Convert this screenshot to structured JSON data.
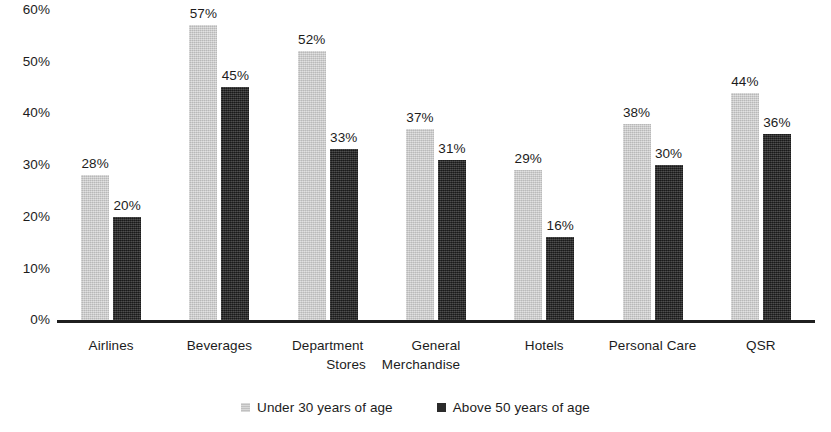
{
  "chart_data": {
    "type": "bar",
    "title": "",
    "subtitle": "",
    "xlabel": "",
    "ylabel": "",
    "ylim": [
      0,
      60
    ],
    "y_ticks": [
      "0%",
      "10%",
      "20%",
      "30%",
      "40%",
      "50%",
      "60%"
    ],
    "y_tick_values": [
      0,
      10,
      20,
      30,
      40,
      50,
      60
    ],
    "grid": false,
    "legend_position": "bottom-center",
    "value_suffix": "%",
    "categories": [
      "Airlines",
      "Department Stores",
      "Beverages",
      "General Merchandise",
      "Hotels",
      "Personal Care",
      "QSR"
    ],
    "category_lines": [
      [
        "Airlines"
      ],
      [
        "Beverages"
      ],
      [
        "Department",
        "Stores"
      ],
      [
        "General",
        "Merchandise"
      ],
      [
        "Hotels"
      ],
      [
        "Personal Care"
      ],
      [
        "QSR"
      ]
    ],
    "series": [
      {
        "name": "Under 30 years of age",
        "color": "#c9c9c9",
        "values": [
          28,
          57,
          52,
          37,
          29,
          38,
          44
        ],
        "labels": [
          "28%",
          "57%",
          "52%",
          "37%",
          "29%",
          "38%",
          "44%"
        ]
      },
      {
        "name": "Above 50 years of age",
        "color": "#2b2b2b",
        "values": [
          20,
          45,
          33,
          31,
          16,
          30,
          36
        ],
        "labels": [
          "20%",
          "45%",
          "33%",
          "31%",
          "16%",
          "30%",
          "36%"
        ]
      }
    ]
  },
  "legend": {
    "items": [
      {
        "label": "Under 30 years of age",
        "color": "#c9c9c9"
      },
      {
        "label": "Above 50 years of age",
        "color": "#2b2b2b"
      }
    ]
  },
  "axis": {
    "y_ticks": [
      {
        "label": "60%"
      },
      {
        "label": "50%"
      },
      {
        "label": "40%"
      },
      {
        "label": "30%"
      },
      {
        "label": "20%"
      },
      {
        "label": "10%"
      },
      {
        "label": "0%"
      }
    ]
  }
}
